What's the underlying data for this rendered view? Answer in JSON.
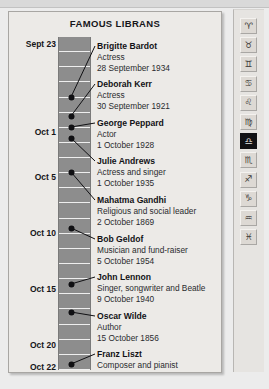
{
  "panel": {
    "title": "FAMOUS LIBRANS",
    "background_color": "#eceae7",
    "bar_color": "#8d8d8d",
    "dot_color": "#101013"
  },
  "date_labels": [
    {
      "text": "Sept 23",
      "top": 27,
      "bold": true
    },
    {
      "text": "Oct 1",
      "top": 115,
      "bold": true
    },
    {
      "text": "Oct 5",
      "top": 160,
      "bold": true
    },
    {
      "text": "Oct 10",
      "top": 216,
      "bold": true
    },
    {
      "text": "Oct 15",
      "top": 272,
      "bold": true
    },
    {
      "text": "Oct 20",
      "top": 328,
      "bold": true
    },
    {
      "text": "Oct 22",
      "top": 350,
      "bold": true
    }
  ],
  "entries": [
    {
      "name": "Brigitte Bardot",
      "role": "Actress",
      "date": "28 September 1934",
      "text_top": 29,
      "dot_top": 85
    },
    {
      "name": "Deborah Kerr",
      "role": "Actress",
      "date": "30 September 1921",
      "text_top": 67,
      "dot_top": 104
    },
    {
      "name": "George Peppard",
      "role": "Actor",
      "date": "1 October 1928",
      "text_top": 106,
      "dot_top": 115
    },
    {
      "name": "Julie Andrews",
      "role": "Actress and singer",
      "date": "1 October 1935",
      "text_top": 144,
      "dot_top": 126
    },
    {
      "name": "Mahatma Gandhi",
      "role": "Religious and social leader",
      "date": "2 October 1869",
      "text_top": 183,
      "dot_top": 160
    },
    {
      "name": "Bob Geldof",
      "role": "Musician and fund-raiser",
      "date": "5 October 1954",
      "text_top": 222,
      "dot_top": 216
    },
    {
      "name": "John Lennon",
      "role": "Singer, songwriter and Beatle",
      "date": "9 October 1940",
      "text_top": 260,
      "dot_top": 272
    },
    {
      "name": "Oscar Wilde",
      "role": "Author",
      "date": "15 October 1856",
      "text_top": 299,
      "dot_top": 300
    },
    {
      "name": "Franz Liszt",
      "role": "Composer and pianist",
      "date": "22 October 1811",
      "text_top": 337,
      "dot_top": 352
    }
  ],
  "toolbar": {
    "selected_index": 6,
    "buttons": [
      {
        "name": "aries-icon",
        "label": "Aries",
        "glyph": "♈"
      },
      {
        "name": "taurus-icon",
        "label": "Taurus",
        "glyph": "♉"
      },
      {
        "name": "gemini-icon",
        "label": "Gemini",
        "glyph": "♊"
      },
      {
        "name": "cancer-icon",
        "label": "Cancer",
        "glyph": "♋"
      },
      {
        "name": "leo-icon",
        "label": "Leo",
        "glyph": "♌"
      },
      {
        "name": "virgo-icon",
        "label": "Virgo",
        "glyph": "♍"
      },
      {
        "name": "libra-icon",
        "label": "Libra",
        "glyph": "♎"
      },
      {
        "name": "scorpio-icon",
        "label": "Scorpio",
        "glyph": "♏"
      },
      {
        "name": "sagittarius-icon",
        "label": "Sagittarius",
        "glyph": "♐"
      },
      {
        "name": "capricorn-icon",
        "label": "Capricorn",
        "glyph": "♑"
      },
      {
        "name": "aquarius-icon",
        "label": "Aquarius",
        "glyph": "♒"
      },
      {
        "name": "pisces-icon",
        "label": "Pisces",
        "glyph": "♓"
      }
    ]
  }
}
